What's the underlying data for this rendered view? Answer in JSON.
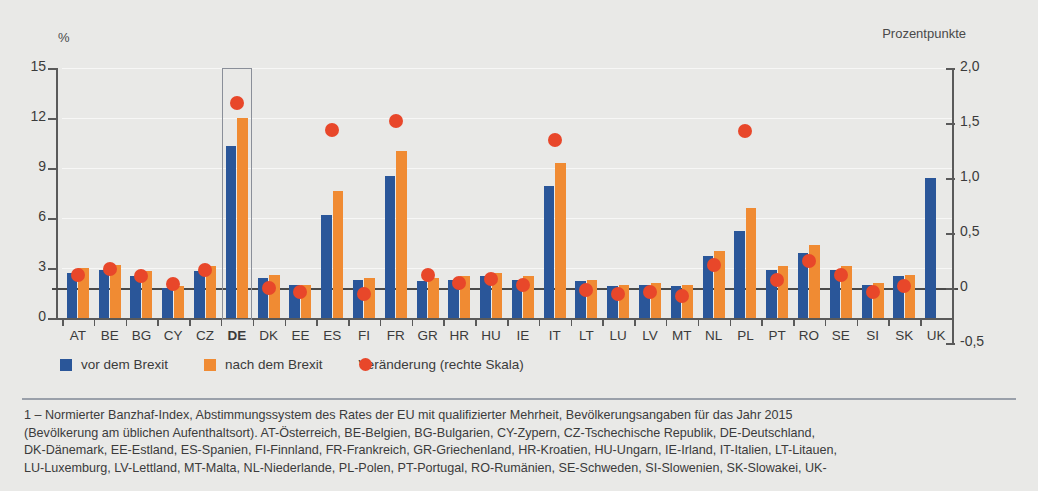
{
  "chart_data": {
    "type": "bar",
    "title": "",
    "subtitle": "",
    "xlabel": "",
    "ylabel_left": "%",
    "ylabel_right": "Prozentpunkte",
    "ylim_left": [
      0,
      15
    ],
    "ylim_right": [
      -0.5,
      2.0
    ],
    "yticks_left": [
      "0",
      "3",
      "6",
      "9",
      "12",
      "15"
    ],
    "yticks_left_values": [
      0,
      3,
      6,
      9,
      12,
      15
    ],
    "yticks_right": [
      "-0,5",
      "0",
      "0,5",
      "1,0",
      "1,5",
      "2,0"
    ],
    "yticks_right_values": [
      -0.5,
      0,
      0.5,
      1.0,
      1.5,
      2.0
    ],
    "grid": true,
    "legend_position": "bottom-left",
    "highlight_category": "DE",
    "categories": [
      "AT",
      "BE",
      "BG",
      "CY",
      "CZ",
      "DE",
      "DK",
      "EE",
      "ES",
      "FI",
      "FR",
      "GR",
      "HR",
      "HU",
      "IE",
      "IT",
      "LT",
      "LU",
      "LV",
      "MT",
      "NL",
      "PL",
      "PT",
      "RO",
      "SE",
      "SI",
      "SK",
      "UK"
    ],
    "series": [
      {
        "name": "vor dem Brexit",
        "color": "#2a5699",
        "axis": "left",
        "values": [
          2.7,
          2.9,
          2.5,
          1.8,
          2.8,
          10.3,
          2.4,
          2.0,
          6.2,
          2.3,
          8.5,
          2.2,
          2.3,
          2.5,
          2.3,
          7.9,
          2.2,
          1.9,
          2.0,
          1.9,
          3.7,
          5.2,
          2.9,
          3.9,
          2.9,
          2.0,
          2.5,
          8.4
        ]
      },
      {
        "name": "nach dem Brexit",
        "color": "#f08b33",
        "axis": "left",
        "values": [
          3.0,
          3.2,
          2.8,
          1.9,
          3.1,
          12.0,
          2.6,
          2.0,
          7.6,
          2.4,
          10.0,
          2.4,
          2.5,
          2.7,
          2.5,
          9.3,
          2.3,
          2.0,
          2.1,
          2.0,
          4.0,
          6.6,
          3.1,
          4.4,
          3.1,
          2.1,
          2.6,
          null
        ]
      },
      {
        "name": "Veränderung (rechte Skala)",
        "color": "#e8472a",
        "axis": "right",
        "marker": "circle",
        "values": [
          0.12,
          0.17,
          0.11,
          0.04,
          0.16,
          1.68,
          0.0,
          -0.04,
          1.44,
          -0.05,
          1.52,
          0.12,
          0.05,
          0.08,
          0.03,
          1.35,
          -0.02,
          -0.05,
          -0.04,
          -0.07,
          0.21,
          1.43,
          0.07,
          0.25,
          0.12,
          -0.04,
          0.02,
          null
        ]
      }
    ]
  },
  "legend": {
    "items": [
      {
        "label": "vor dem Brexit",
        "type": "square",
        "color": "#2a5699"
      },
      {
        "label": "nach dem Brexit",
        "type": "square",
        "color": "#f08b33"
      },
      {
        "label": "Veränderung (rechte Skala)",
        "type": "circle",
        "color": "#e8472a"
      }
    ]
  },
  "footnote": {
    "lines": [
      "1 – Normierter Banzhaf-Index, Abstimmungssystem des Rates der EU mit qualifizierter Mehrheit, Bevölkerungsangaben für das Jahr 2015",
      "(Bevölkerung am üblichen Aufenthaltsort). AT-Österreich, BE-Belgien, BG-Bulgarien, CY-Zypern, CZ-Tschechische Republik, DE-Deutschland,",
      "DK-Dänemark, EE-Estland, ES-Spanien, FI-Finnland, FR-Frankreich, GR-Griechenland, HR-Kroatien, HU-Ungarn, IE-Irland, IT-Italien, LT-Litauen,",
      "LU-Luxemburg, LV-Lettland, MT-Malta, NL-Niederlande, PL-Polen, PT-Portugal, RO-Rumänien, SE-Schweden, SI-Slowenien, SK-Slowakei, UK-"
    ]
  }
}
